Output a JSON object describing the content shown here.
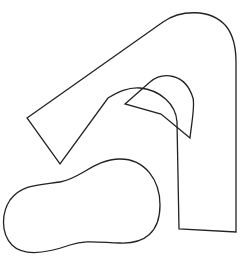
{
  "canvas": {
    "width": 245,
    "height": 265,
    "background": "#ffffff"
  },
  "stroke": {
    "color": "#222222",
    "width": 1.3
  },
  "shapes": [
    {
      "name": "arch-shape",
      "description": "Large A-like outline with rounded top-right",
      "path": "M 27 118 L 163 22 C 180 10 210 8 226 26 C 234 36 236 48 236 62 L 236 232 L 179 229 L 177 122 C 176 104 160 90 140 88 C 128 87 118 92 108 98 L 60 164 Z"
    },
    {
      "name": "inner-cutout",
      "description": "Inner quarter-round cutout",
      "path": "M 125 104 L 150 82 C 162 72 185 72 193 98 C 195 106 192 120 190 138 L 161 114 Z"
    },
    {
      "name": "blob-shape",
      "description": "Peanut-shaped closed curve at bottom left",
      "path": "M 120 159 C 145 159 160 180 160 205 C 160 232 145 244 120 243 C 95 242 85 240 70 245 C 50 252 25 258 12 245 C 0 232 2 212 10 200 C 22 184 40 185 60 182 C 80 179 95 159 120 159 Z"
    }
  ]
}
